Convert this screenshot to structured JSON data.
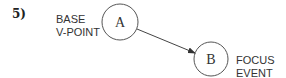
{
  "figure": {
    "number": "5)",
    "nodes": [
      {
        "id": "A",
        "letter": "A",
        "label_line1": "BASE",
        "label_line2": "V-POINT"
      },
      {
        "id": "B",
        "letter": "B",
        "label_line1": "FOCUS",
        "label_line2": "EVENT"
      }
    ],
    "edges": [
      {
        "from": "A",
        "to": "B",
        "directed": true
      }
    ],
    "colors": {
      "stroke": "#444444",
      "text": "#333333"
    }
  }
}
